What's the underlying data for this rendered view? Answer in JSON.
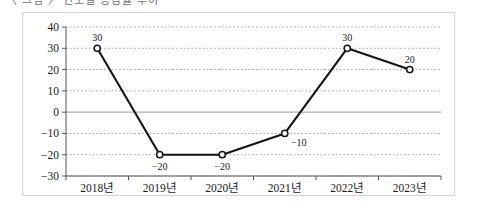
{
  "header": {
    "cropped_text_fragment": "〈 그림 〉 연도별 증감률 추이"
  },
  "chart_data": {
    "type": "line",
    "title": "",
    "xlabel": "",
    "ylabel": "",
    "categories": [
      "2018년",
      "2019년",
      "2020년",
      "2021년",
      "2022년",
      "2023년"
    ],
    "values": [
      30,
      -20,
      -20,
      -10,
      30,
      20
    ],
    "point_labels": [
      "30",
      "−20",
      "−20",
      "−10",
      "30",
      "20"
    ],
    "point_label_position": [
      "above",
      "below",
      "below",
      "below-right",
      "above",
      "above"
    ],
    "ylim": [
      -30,
      40
    ],
    "ytick_values": [
      40,
      30,
      20,
      10,
      0,
      -10,
      -20,
      -30
    ],
    "ytick_labels": [
      "40",
      "30",
      "20",
      "10",
      "0",
      "−10",
      "−20",
      "−30"
    ],
    "grid": true,
    "grid_style": "dotted",
    "zero_line": true,
    "legend": false,
    "marker": "open-circle",
    "line_color": "#141414",
    "grid_color": "#9a9a9a",
    "zero_line_color": "#b0b0b0",
    "border_color": "#d3d3d3"
  }
}
